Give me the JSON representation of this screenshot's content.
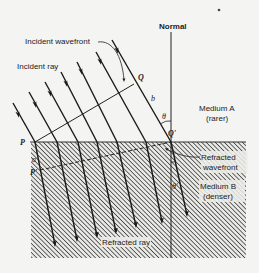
{
  "diagram": {
    "type": "refraction-of-plane-wave",
    "labels": {
      "normal": "Normal",
      "incident_wavefront": "Incident wavefront",
      "incident_ray": "Incident ray",
      "point_q": "Q",
      "point_q_prime": "Q'",
      "point_p": "P",
      "point_p_prime": "P'",
      "segment_b": "b",
      "segment_a": "a",
      "angle_theta": "θ",
      "angle_theta_prime": "θ'",
      "medium_a_name": "Medium A",
      "medium_a_desc": "(rarer)",
      "medium_b_name": "Medium B",
      "medium_b_desc": "(denser)",
      "refracted_wavefront_1": "Refracted",
      "refracted_wavefront_2": "wavefront",
      "refracted_ray": "Refracted ray"
    },
    "colors": {
      "background": "#f4f4f2",
      "ink": "#222222",
      "hatch": "#3a3a3a"
    },
    "incident_ray_count": 7,
    "refracted_ray_count": 7
  }
}
